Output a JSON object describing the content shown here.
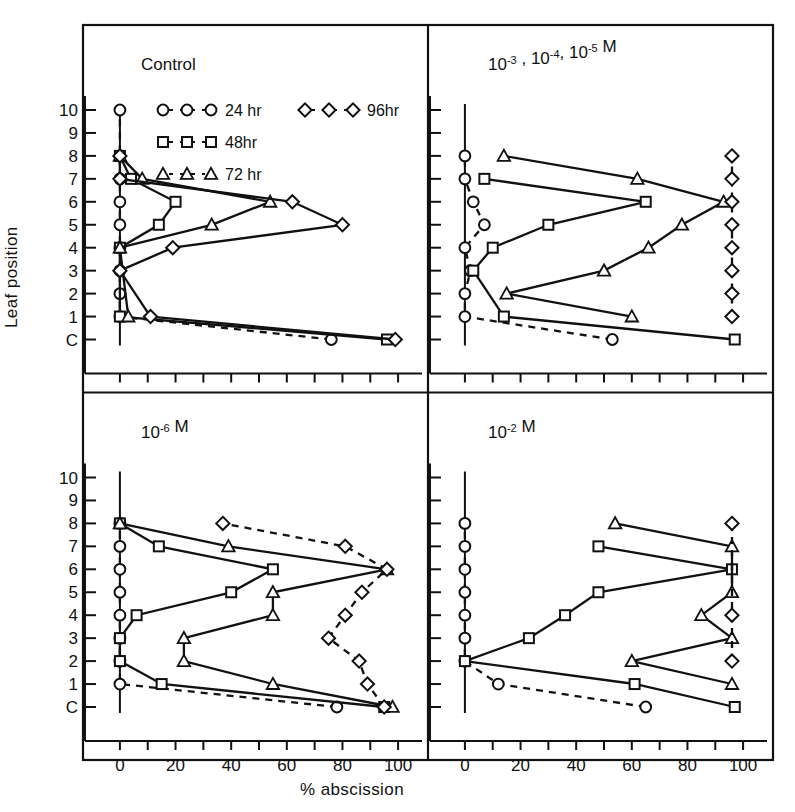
{
  "figure": {
    "axis_y_label": "Leaf position",
    "axis_x_label": "% abscission",
    "y_ticks": [
      "C",
      "1",
      "2",
      "3",
      "4",
      "5",
      "6",
      "7",
      "8",
      "9",
      "10"
    ],
    "x_ticks": [
      "0",
      "20",
      "40",
      "60",
      "80",
      "100"
    ],
    "x_minor_step": 10,
    "line_color": "#111111",
    "background": "#ffffff"
  },
  "legend": {
    "position": "top-left-panel",
    "entries": [
      {
        "marker": "circle",
        "sample": "O-O-O",
        "label": "24 hr"
      },
      {
        "marker": "square",
        "sample": "□-□-□",
        "label": "48hr"
      },
      {
        "marker": "triangle",
        "sample": "△-△-△",
        "label": "72 hr"
      },
      {
        "marker": "diamond",
        "sample": "◇-◇-◇",
        "label": "96hr"
      }
    ]
  },
  "chart_data": {
    "type": "line",
    "title": "",
    "xlabel": "% abscission",
    "ylabel": "Leaf position",
    "xlim": [
      -5,
      105
    ],
    "ylim_categories": [
      "C",
      "1",
      "2",
      "3",
      "4",
      "5",
      "6",
      "7",
      "8",
      "9",
      "10"
    ],
    "grid": false,
    "legend_position": "inside-top-left-panel",
    "panels": [
      {
        "id": "control",
        "title": "Control",
        "title_html": "Control",
        "position": "top-left",
        "series": [
          {
            "name": "24 hr",
            "marker": "circle",
            "linestyle": "dashed",
            "points": [
              {
                "y": "C",
                "x": 76
              },
              {
                "y": "1",
                "x": 0
              },
              {
                "y": "2",
                "x": 0
              },
              {
                "y": "3",
                "x": 0
              },
              {
                "y": "4",
                "x": 0
              },
              {
                "y": "5",
                "x": 0
              },
              {
                "y": "6",
                "x": 0
              },
              {
                "y": "7",
                "x": 0
              },
              {
                "y": "8",
                "x": 0
              },
              {
                "y": "10",
                "x": 0
              }
            ]
          },
          {
            "name": "48hr",
            "marker": "square",
            "linestyle": "solid",
            "points": [
              {
                "y": "C",
                "x": 96
              },
              {
                "y": "1",
                "x": 0
              },
              {
                "y": "4",
                "x": 0
              },
              {
                "y": "5",
                "x": 14
              },
              {
                "y": "6",
                "x": 20
              },
              {
                "y": "7",
                "x": 4
              },
              {
                "y": "8",
                "x": 0
              }
            ]
          },
          {
            "name": "72 hr",
            "marker": "triangle",
            "linestyle": "solid",
            "points": [
              {
                "y": "1",
                "x": 3
              },
              {
                "y": "4",
                "x": 0
              },
              {
                "y": "5",
                "x": 33
              },
              {
                "y": "6",
                "x": 54
              },
              {
                "y": "7",
                "x": 8
              },
              {
                "y": "8",
                "x": 0
              }
            ]
          },
          {
            "name": "96hr",
            "marker": "diamond",
            "linestyle": "solid",
            "points": [
              {
                "y": "C",
                "x": 99
              },
              {
                "y": "1",
                "x": 11
              },
              {
                "y": "3",
                "x": 0
              },
              {
                "y": "4",
                "x": 19
              },
              {
                "y": "5",
                "x": 80
              },
              {
                "y": "6",
                "x": 62
              },
              {
                "y": "7",
                "x": 0
              },
              {
                "y": "8",
                "x": 0
              }
            ]
          }
        ]
      },
      {
        "id": "high-conc",
        "title": "10^-3 , 10^-4, 10^-5 M",
        "title_parts": [
          {
            "base": "10",
            "exp": "-3"
          },
          {
            "sep": " , "
          },
          {
            "base": "10",
            "exp": "-4"
          },
          {
            "sep": ", "
          },
          {
            "base": "10",
            "exp": "-5"
          },
          {
            "sep": " M"
          }
        ],
        "position": "top-right",
        "series": [
          {
            "name": "24 hr",
            "marker": "circle",
            "linestyle": "dashed",
            "points": [
              {
                "y": "C",
                "x": 53
              },
              {
                "y": "1",
                "x": 0
              },
              {
                "y": "2",
                "x": 0
              },
              {
                "y": "3",
                "x": 2
              },
              {
                "y": "4",
                "x": 0
              },
              {
                "y": "5",
                "x": 7
              },
              {
                "y": "6",
                "x": 3
              },
              {
                "y": "7",
                "x": 0
              },
              {
                "y": "8",
                "x": 0
              }
            ]
          },
          {
            "name": "48hr",
            "marker": "square",
            "linestyle": "solid",
            "points": [
              {
                "y": "C",
                "x": 97
              },
              {
                "y": "1",
                "x": 14
              },
              {
                "y": "3",
                "x": 3
              },
              {
                "y": "4",
                "x": 10
              },
              {
                "y": "5",
                "x": 30
              },
              {
                "y": "6",
                "x": 65
              },
              {
                "y": "7",
                "x": 7
              }
            ]
          },
          {
            "name": "72 hr",
            "marker": "triangle",
            "linestyle": "solid",
            "points": [
              {
                "y": "1",
                "x": 60
              },
              {
                "y": "2",
                "x": 15
              },
              {
                "y": "3",
                "x": 50
              },
              {
                "y": "4",
                "x": 66
              },
              {
                "y": "5",
                "x": 78
              },
              {
                "y": "6",
                "x": 93
              },
              {
                "y": "7",
                "x": 62
              },
              {
                "y": "8",
                "x": 14
              }
            ]
          },
          {
            "name": "96hr",
            "marker": "diamond",
            "linestyle": "dashed",
            "points": [
              {
                "y": "1",
                "x": 96
              },
              {
                "y": "2",
                "x": 96
              },
              {
                "y": "3",
                "x": 96
              },
              {
                "y": "4",
                "x": 96
              },
              {
                "y": "5",
                "x": 96
              },
              {
                "y": "6",
                "x": 96
              },
              {
                "y": "7",
                "x": 96
              },
              {
                "y": "8",
                "x": 96
              }
            ]
          }
        ]
      },
      {
        "id": "low-conc",
        "title": "10^-6 M",
        "title_parts": [
          {
            "base": "10",
            "exp": "-6"
          },
          {
            "sep": " M"
          }
        ],
        "position": "bottom-left",
        "series": [
          {
            "name": "24 hr",
            "marker": "circle",
            "linestyle": "dashed",
            "points": [
              {
                "y": "C",
                "x": 78
              },
              {
                "y": "1",
                "x": 0
              },
              {
                "y": "2",
                "x": 0
              },
              {
                "y": "3",
                "x": 0
              },
              {
                "y": "4",
                "x": 0
              },
              {
                "y": "5",
                "x": 0
              },
              {
                "y": "6",
                "x": 0
              },
              {
                "y": "7",
                "x": 0
              },
              {
                "y": "8",
                "x": 0
              }
            ]
          },
          {
            "name": "48hr",
            "marker": "square",
            "linestyle": "solid",
            "points": [
              {
                "y": "C",
                "x": 95
              },
              {
                "y": "1",
                "x": 15
              },
              {
                "y": "2",
                "x": 0
              },
              {
                "y": "3",
                "x": 0
              },
              {
                "y": "4",
                "x": 6
              },
              {
                "y": "5",
                "x": 40
              },
              {
                "y": "6",
                "x": 55
              },
              {
                "y": "7",
                "x": 14
              },
              {
                "y": "8",
                "x": 0
              }
            ]
          },
          {
            "name": "72 hr",
            "marker": "triangle",
            "linestyle": "solid",
            "points": [
              {
                "y": "C",
                "x": 98
              },
              {
                "y": "1",
                "x": 55
              },
              {
                "y": "2",
                "x": 23
              },
              {
                "y": "3",
                "x": 23
              },
              {
                "y": "4",
                "x": 55
              },
              {
                "y": "5",
                "x": 55
              },
              {
                "y": "6",
                "x": 96
              },
              {
                "y": "7",
                "x": 39
              },
              {
                "y": "8",
                "x": 0
              }
            ]
          },
          {
            "name": "96hr",
            "marker": "diamond",
            "linestyle": "dashed",
            "points": [
              {
                "y": "C",
                "x": 95
              },
              {
                "y": "1",
                "x": 89
              },
              {
                "y": "2",
                "x": 86
              },
              {
                "y": "3",
                "x": 75
              },
              {
                "y": "4",
                "x": 81
              },
              {
                "y": "5",
                "x": 87
              },
              {
                "y": "6",
                "x": 96
              },
              {
                "y": "7",
                "x": 81
              },
              {
                "y": "8",
                "x": 37
              }
            ]
          }
        ]
      },
      {
        "id": "very-high-conc",
        "title": "10^-2 M",
        "title_parts": [
          {
            "base": "10",
            "exp": "-2"
          },
          {
            "sep": " M"
          }
        ],
        "position": "bottom-right",
        "series": [
          {
            "name": "24 hr",
            "marker": "circle",
            "linestyle": "dashed",
            "points": [
              {
                "y": "C",
                "x": 65
              },
              {
                "y": "1",
                "x": 12
              },
              {
                "y": "2",
                "x": 0
              },
              {
                "y": "3",
                "x": 0
              },
              {
                "y": "4",
                "x": 0
              },
              {
                "y": "5",
                "x": 0
              },
              {
                "y": "6",
                "x": 0
              },
              {
                "y": "7",
                "x": 0
              },
              {
                "y": "8",
                "x": 0
              }
            ]
          },
          {
            "name": "48hr",
            "marker": "square",
            "linestyle": "solid",
            "points": [
              {
                "y": "C",
                "x": 97
              },
              {
                "y": "1",
                "x": 61
              },
              {
                "y": "2",
                "x": 0
              },
              {
                "y": "3",
                "x": 23
              },
              {
                "y": "4",
                "x": 36
              },
              {
                "y": "5",
                "x": 48
              },
              {
                "y": "6",
                "x": 96
              },
              {
                "y": "7",
                "x": 48
              }
            ]
          },
          {
            "name": "72 hr",
            "marker": "triangle",
            "linestyle": "solid",
            "points": [
              {
                "y": "1",
                "x": 96
              },
              {
                "y": "2",
                "x": 60
              },
              {
                "y": "3",
                "x": 96
              },
              {
                "y": "4",
                "x": 85
              },
              {
                "y": "5",
                "x": 96
              },
              {
                "y": "7",
                "x": 96
              },
              {
                "y": "8",
                "x": 54
              }
            ]
          },
          {
            "name": "96hr",
            "marker": "diamond",
            "linestyle": "dashed",
            "points": [
              {
                "y": "2",
                "x": 96
              },
              {
                "y": "4",
                "x": 96
              },
              {
                "y": "8",
                "x": 96
              }
            ]
          }
        ]
      }
    ]
  }
}
